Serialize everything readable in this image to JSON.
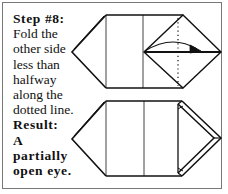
{
  "instruction": {
    "step_label": "Step #8:",
    "lines": [
      "Fold the",
      "other side",
      "less than",
      "halfway",
      "along the",
      "dotted line."
    ],
    "result_label": "Result:",
    "result_lines": [
      "A",
      "partially",
      "open eye."
    ]
  },
  "diagrams": [
    {
      "name": "before-fold",
      "description": "Paper with right diamond flap, dotted fold line and arrow"
    },
    {
      "name": "after-fold",
      "description": "Paper with partially folded right flap forming an open eye"
    }
  ],
  "colors": {
    "line": "#111111",
    "border": "#777777",
    "background": "#ffffff"
  }
}
